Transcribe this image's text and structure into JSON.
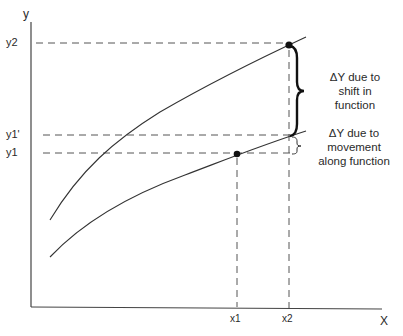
{
  "axes": {
    "y_label": "y",
    "x_label": "X",
    "y_ticks": [
      {
        "label": "y2",
        "y": 43
      },
      {
        "label": "y1'",
        "y": 135
      },
      {
        "label": "y1",
        "y": 153
      }
    ],
    "x_ticks": [
      {
        "label": "x1",
        "x": 237
      },
      {
        "label": "x2",
        "x": 289
      }
    ]
  },
  "curves": [
    {
      "name": "shifted-function",
      "description": "upper curve"
    },
    {
      "name": "original-function",
      "description": "lower curve"
    }
  ],
  "points": [
    {
      "name": "point-x2-y2",
      "x_label": "x2",
      "y_label": "y2"
    },
    {
      "name": "point-x1-y1",
      "x_label": "x1",
      "y_label": "y1"
    }
  ],
  "annotations": {
    "shift": {
      "line1": "ΔY due to",
      "line2": "shift in",
      "line3": "function"
    },
    "movement": {
      "line1": "ΔY due to",
      "line2": "movement",
      "line3": "along function"
    }
  },
  "colors": {
    "line": "#333333",
    "dashed": "#444444",
    "background": "#ffffff"
  }
}
